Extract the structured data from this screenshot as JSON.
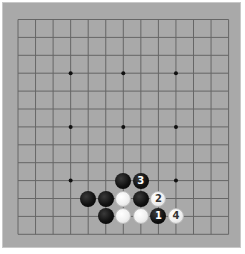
{
  "board": {
    "size": 13,
    "background": "#a9a9a9",
    "line_color": "#666666",
    "hoshi": [
      [
        3,
        3
      ],
      [
        3,
        6
      ],
      [
        3,
        9
      ],
      [
        6,
        3
      ],
      [
        6,
        6
      ],
      [
        6,
        9
      ],
      [
        9,
        3
      ],
      [
        9,
        6
      ],
      [
        9,
        9
      ]
    ]
  },
  "stones": [
    {
      "color": "black",
      "col": 6,
      "row": 9,
      "label": ""
    },
    {
      "color": "black",
      "col": 7,
      "row": 9,
      "label": "3"
    },
    {
      "color": "black",
      "col": 4,
      "row": 10,
      "label": ""
    },
    {
      "color": "black",
      "col": 5,
      "row": 10,
      "label": ""
    },
    {
      "color": "white",
      "col": 6,
      "row": 10,
      "label": ""
    },
    {
      "color": "black",
      "col": 7,
      "row": 10,
      "label": ""
    },
    {
      "color": "white",
      "col": 8,
      "row": 10,
      "label": "2"
    },
    {
      "color": "black",
      "col": 5,
      "row": 11,
      "label": ""
    },
    {
      "color": "white",
      "col": 6,
      "row": 11,
      "label": ""
    },
    {
      "color": "white",
      "col": 7,
      "row": 11,
      "label": ""
    },
    {
      "color": "black",
      "col": 8,
      "row": 11,
      "label": "1"
    },
    {
      "color": "white",
      "col": 9,
      "row": 11,
      "label": "4"
    }
  ]
}
